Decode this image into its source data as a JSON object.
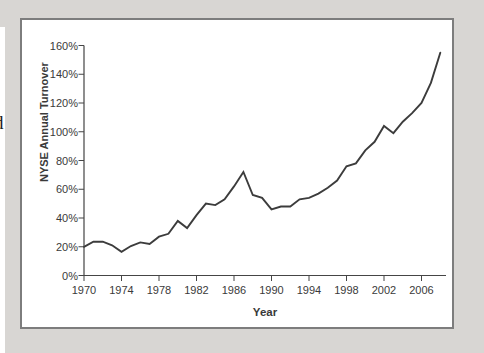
{
  "page": {
    "cropped_text_fragment": "d",
    "panel_color": "#d8d6d3",
    "chart_frame_border_color": "#7d7d7d"
  },
  "chart_data": {
    "type": "line",
    "title": "",
    "ylabel": "NYSE Annual Turnover",
    "xlabel": "Year",
    "x": [
      1970,
      1971,
      1972,
      1973,
      1974,
      1975,
      1976,
      1977,
      1978,
      1979,
      1980,
      1981,
      1982,
      1983,
      1984,
      1985,
      1986,
      1987,
      1988,
      1989,
      1990,
      1991,
      1992,
      1993,
      1994,
      1995,
      1996,
      1997,
      1998,
      1999,
      2000,
      2001,
      2002,
      2003,
      2004,
      2005,
      2006,
      2007,
      2008
    ],
    "values": [
      20,
      23.5,
      23.5,
      21,
      16.5,
      20.5,
      23,
      22,
      27,
      29,
      38,
      33,
      42,
      50,
      49,
      53,
      62,
      72,
      56,
      54,
      46,
      48,
      48,
      53,
      54,
      57,
      61,
      66,
      76,
      78,
      87,
      93,
      104,
      99,
      107,
      113,
      120,
      134,
      155
    ],
    "series_name": "NYSE annual share turnover (%)",
    "ylim": [
      0,
      160
    ],
    "xlim": [
      1970,
      2008.6
    ],
    "y_ticks": [
      0,
      20,
      40,
      60,
      80,
      100,
      120,
      140,
      160
    ],
    "y_tick_labels": [
      "0%",
      "20%",
      "40%",
      "60%",
      "80%",
      "100%",
      "120%",
      "140%",
      "160%"
    ],
    "x_ticks": [
      1970,
      1974,
      1978,
      1982,
      1986,
      1990,
      1994,
      1998,
      2002,
      2006
    ],
    "x_tick_labels": [
      "1970",
      "1974",
      "1978",
      "1982",
      "1986",
      "1990",
      "1994",
      "1998",
      "2002",
      "2006"
    ],
    "grid": false,
    "legend": "none",
    "line_color": "#3c3c3c",
    "axis_color": "#454545"
  }
}
